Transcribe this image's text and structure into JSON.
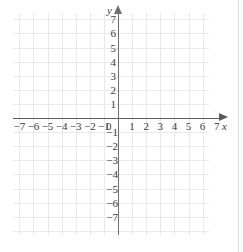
{
  "chart_data": {
    "type": "scatter",
    "title": "",
    "subtitle": "",
    "xlabel": "x",
    "ylabel": "y",
    "xlim": [
      -7,
      7
    ],
    "ylim": [
      -7,
      7
    ],
    "grid": true,
    "legend": null,
    "x_ticks": [
      -7,
      -6,
      -5,
      -4,
      -3,
      -2,
      -1,
      0,
      1,
      2,
      3,
      4,
      5,
      6,
      7
    ],
    "y_ticks": [
      7,
      6,
      5,
      4,
      3,
      2,
      1,
      0,
      -1,
      -2,
      -3,
      -4,
      -5,
      -6,
      -7
    ],
    "x_tick_labels": [
      "−7",
      "−6",
      "−5",
      "−4",
      "−3",
      "−2",
      "−1",
      "0",
      "1",
      "2",
      "3",
      "4",
      "5",
      "6",
      "7"
    ],
    "y_tick_labels_positive": [
      "7",
      "6",
      "5",
      "4",
      "3",
      "2",
      "1"
    ],
    "y_tick_labels_negative": [
      "−1",
      "−2",
      "−3",
      "−4",
      "−5",
      "−6",
      "−7"
    ],
    "series": [],
    "values": [],
    "annotations": []
  },
  "axes": {
    "origin_label": "0",
    "x_axis_name": "x",
    "y_axis_name": "y"
  },
  "colors": {
    "gridline": "#e9e9e9",
    "x_axis": "#5b5b5b",
    "y_axis": "#6e6e6e",
    "label_text": "#3a3a3a",
    "background": "#ffffff"
  }
}
